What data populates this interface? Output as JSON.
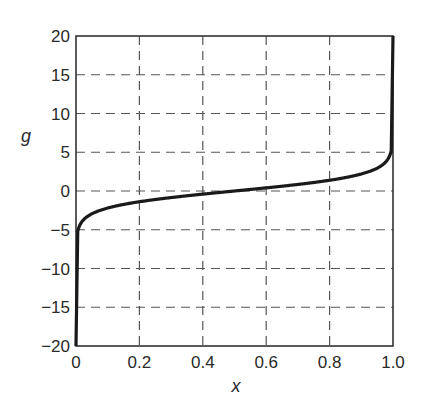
{
  "chart_data": {
    "type": "line",
    "title": "",
    "xlabel": "x",
    "ylabel": "g",
    "xlim": [
      0,
      1.0
    ],
    "ylim": [
      -20,
      20
    ],
    "grid": true,
    "grid_style": "dashed",
    "legend": null,
    "x_ticks": [
      0,
      0.2,
      0.4,
      0.6,
      0.8,
      1.0
    ],
    "x_tick_labels": [
      "0",
      "0.2",
      "0.4",
      "0.6",
      "0.8",
      "1.0"
    ],
    "y_ticks": [
      20,
      15,
      10,
      5,
      0,
      -5,
      -10,
      -15,
      -20
    ],
    "y_tick_labels": [
      "20",
      "15",
      "10",
      "5",
      "0",
      "−5",
      "−10",
      "−15",
      "−20"
    ],
    "series": [
      {
        "name": "g(x)",
        "color": "#1a1a1a",
        "x": [
          0.0,
          0.003,
          0.005,
          0.01,
          0.02,
          0.05,
          0.1,
          0.2,
          0.3,
          0.4,
          0.5,
          0.6,
          0.7,
          0.8,
          0.9,
          0.95,
          0.98,
          0.99,
          0.995,
          0.997,
          1.0
        ],
        "values": [
          -20,
          -5.8,
          -5.3,
          -4.6,
          -3.89,
          -2.94,
          -2.2,
          -1.39,
          -0.85,
          -0.41,
          0,
          0.41,
          0.85,
          1.39,
          2.2,
          2.94,
          3.89,
          4.6,
          5.3,
          5.8,
          20
        ]
      }
    ]
  }
}
